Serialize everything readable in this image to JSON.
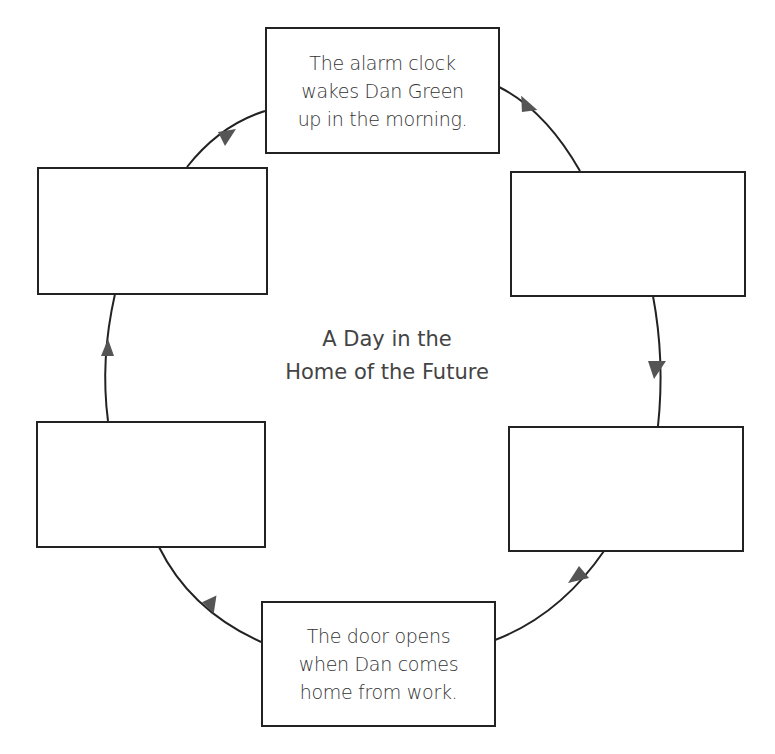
{
  "diagram": {
    "title_line1": "A Day in the",
    "title_line2": "Home of the Future",
    "colors": {
      "line": "#222222",
      "arrow": "#555555",
      "text": "#333333",
      "background": "#ffffff"
    },
    "boxes": [
      {
        "position": "top",
        "text": "The alarm clock\nwakes Dan Green\nup in the morning."
      },
      {
        "position": "top-right",
        "text": ""
      },
      {
        "position": "bottom-right",
        "text": ""
      },
      {
        "position": "bottom",
        "text": "The door opens\nwhen Dan comes\nhome from work."
      },
      {
        "position": "bottom-left",
        "text": ""
      },
      {
        "position": "top-left",
        "text": ""
      }
    ],
    "flow_direction": "clockwise"
  }
}
